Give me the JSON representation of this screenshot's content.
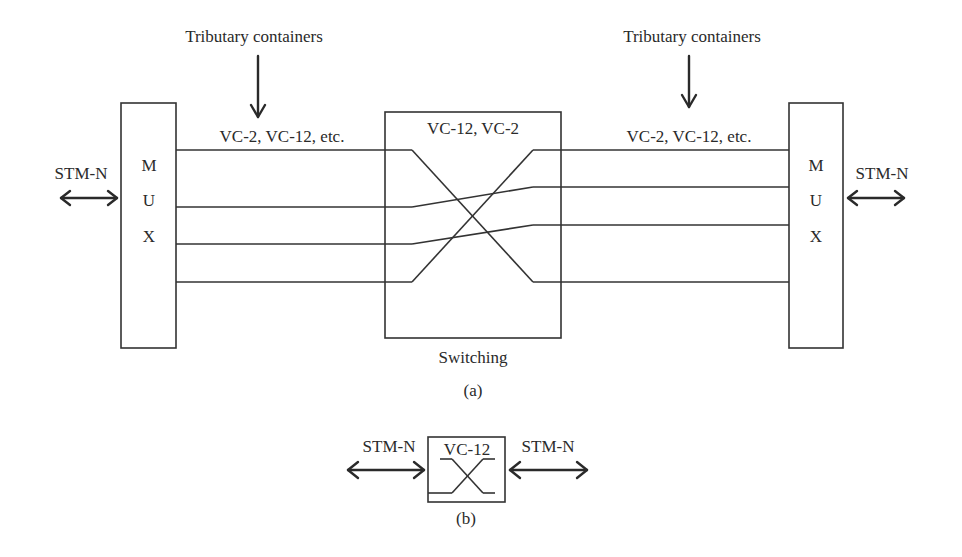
{
  "figure": {
    "part_a": {
      "caption": "(a)",
      "left_annotation": {
        "text": "Tributary containers",
        "icon": "down-arrow-icon"
      },
      "right_annotation": {
        "text": "Tributary containers",
        "icon": "down-arrow-icon"
      },
      "left_mux": {
        "letters": [
          "M",
          "U",
          "X"
        ],
        "port_label": "STM-N",
        "port_icon": "bidirectional-arrow-icon"
      },
      "right_mux": {
        "letters": [
          "M",
          "U",
          "X"
        ],
        "port_label": "STM-N",
        "port_icon": "bidirectional-arrow-icon"
      },
      "left_link_label": "VC-2, VC-12, etc.",
      "right_link_label": "VC-2, VC-12, etc.",
      "switch": {
        "inner_label": "VC-12, VC-2",
        "caption": "Switching"
      },
      "line_count": 4
    },
    "part_b": {
      "caption": "(b)",
      "left_port_label": "STM-N",
      "right_port_label": "STM-N",
      "box_label": "VC-12",
      "port_icon": "bidirectional-arrow-icon"
    }
  },
  "colors": {
    "stroke": "#333333",
    "text": "#2a2a2a",
    "background": "#ffffff"
  }
}
